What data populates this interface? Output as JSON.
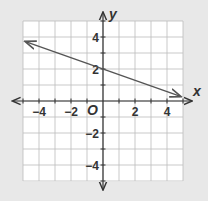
{
  "chart_data": {
    "type": "line",
    "title": "",
    "xlabel": "x",
    "ylabel": "y",
    "origin_label": "O",
    "xlim": [
      -5,
      5
    ],
    "ylim": [
      -5,
      5
    ],
    "grid": true,
    "x_ticks": [
      -4,
      -2,
      2,
      4
    ],
    "y_ticks": [
      4,
      2,
      -2,
      -4
    ],
    "x_tick_labels": [
      "−4",
      "−2",
      "2",
      "4"
    ],
    "y_tick_labels": [
      "4",
      "2",
      "−2",
      "−4"
    ],
    "series": [
      {
        "name": "line",
        "equation": "y = -0.35x + 2",
        "x": [
          -4.8,
          0,
          4.8
        ],
        "y": [
          3.7,
          2,
          0.3
        ],
        "arrows_both_ends": true,
        "color": "#555555"
      }
    ]
  },
  "colors": {
    "background": "#e8e8e8",
    "grid_bg": "#ffffff",
    "grid_line": "#bbbbbb",
    "axis": "#333333",
    "line": "#555555"
  }
}
